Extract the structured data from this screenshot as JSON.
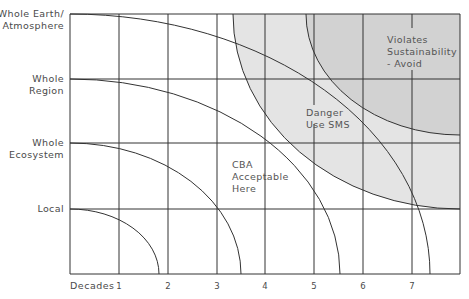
{
  "y_axis": {
    "levels": [
      {
        "line1": "Whole Earth/",
        "line2": "Atmosphere"
      },
      {
        "line1": "Whole",
        "line2": "Region"
      },
      {
        "line1": "Whole",
        "line2": "Ecosystem"
      },
      {
        "line1": "Local",
        "line2": ""
      }
    ]
  },
  "x_axis": {
    "title": "Decades",
    "ticks": [
      "1",
      "2",
      "3",
      "4",
      "5",
      "6",
      "7"
    ]
  },
  "zones": {
    "cba": {
      "line1": "CBA",
      "line2": "Acceptable",
      "line3": "Here"
    },
    "danger": {
      "line1": "Danger",
      "line2": "Use SMS"
    },
    "violates": {
      "line1": "Violates",
      "line2": "Sustainability",
      "line3": "- Avoid"
    }
  },
  "colors": {
    "grid": "#333333",
    "danger_fill": "#e4e4e4",
    "violates_fill": "#d2d2d2",
    "text": "#4a4a4a"
  }
}
